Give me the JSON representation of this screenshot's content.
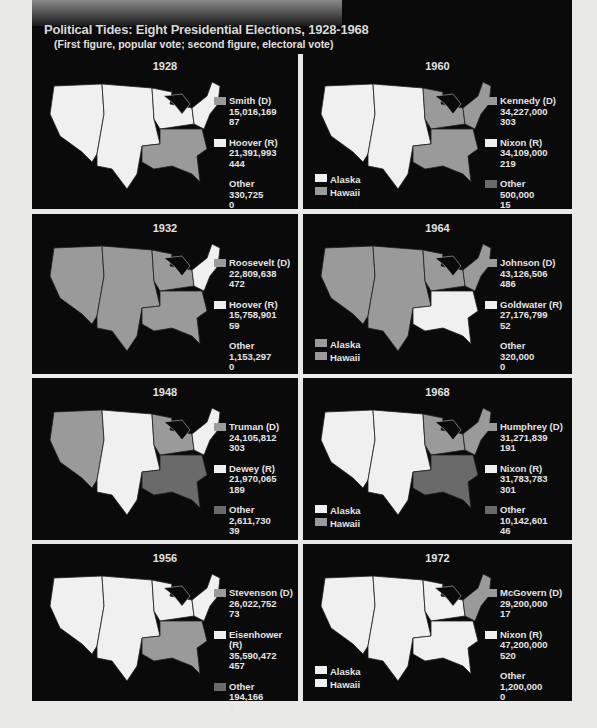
{
  "header": {
    "title": "Political Tides: Eight Presidential Elections, 1928-1968",
    "subtitle": "(First figure, popular vote; second figure, electoral vote)"
  },
  "colors": {
    "democrat": "#9a9a9a",
    "republican": "#f0f0f0",
    "other": "#6a6a6a",
    "background": "#0a0a0a",
    "page": "#e9e9e7"
  },
  "panels": [
    {
      "year": "1928",
      "entries": [
        {
          "name": "Smith (D)",
          "popular": "15,016,169",
          "electoral": "87",
          "swatch": "#9a9a9a"
        },
        {
          "name": "Hoover (R)",
          "popular": "21,391,993",
          "electoral": "444",
          "swatch": "#f0f0f0"
        },
        {
          "name": "Other",
          "popular": "330,725",
          "electoral": "0",
          "swatch": ""
        }
      ]
    },
    {
      "year": "1960",
      "alaska": "Alaska",
      "hawaii": "Hawaii",
      "alaska_color": "#f0f0f0",
      "hawaii_color": "#9a9a9a",
      "entries": [
        {
          "name": "Kennedy (D)",
          "popular": "34,227,000",
          "electoral": "303",
          "swatch": "#9a9a9a"
        },
        {
          "name": "Nixon (R)",
          "popular": "34,109,000",
          "electoral": "219",
          "swatch": "#f0f0f0"
        },
        {
          "name": "Other",
          "popular": "500,000",
          "electoral": "15",
          "swatch": "#6a6a6a"
        }
      ]
    },
    {
      "year": "1932",
      "entries": [
        {
          "name": "Roosevelt (D)",
          "popular": "22,809,638",
          "electoral": "472",
          "swatch": "#9a9a9a"
        },
        {
          "name": "Hoover (R)",
          "popular": "15,758,901",
          "electoral": "59",
          "swatch": "#f0f0f0"
        },
        {
          "name": "Other",
          "popular": "1,153,297",
          "electoral": "0",
          "swatch": ""
        }
      ]
    },
    {
      "year": "1964",
      "alaska": "Alaska",
      "hawaii": "Hawaii",
      "alaska_color": "#9a9a9a",
      "hawaii_color": "#9a9a9a",
      "entries": [
        {
          "name": "Johnson (D)",
          "popular": "43,126,506",
          "electoral": "486",
          "swatch": "#9a9a9a"
        },
        {
          "name": "Goldwater (R)",
          "popular": "27,176,799",
          "electoral": "52",
          "swatch": "#f0f0f0"
        },
        {
          "name": "Other",
          "popular": "320,000",
          "electoral": "0",
          "swatch": ""
        }
      ]
    },
    {
      "year": "1948",
      "entries": [
        {
          "name": "Truman (D)",
          "popular": "24,105,812",
          "electoral": "303",
          "swatch": "#9a9a9a"
        },
        {
          "name": "Dewey (R)",
          "popular": "21,970,065",
          "electoral": "189",
          "swatch": "#f0f0f0"
        },
        {
          "name": "Other",
          "popular": "2,611,730",
          "electoral": "39",
          "swatch": "#6a6a6a"
        }
      ]
    },
    {
      "year": "1968",
      "alaska": "Alaska",
      "hawaii": "Hawaii",
      "alaska_color": "#f0f0f0",
      "hawaii_color": "#9a9a9a",
      "entries": [
        {
          "name": "Humphrey (D)",
          "popular": "31,271,839",
          "electoral": "191",
          "swatch": "#9a9a9a"
        },
        {
          "name": "Nixon (R)",
          "popular": "31,783,783",
          "electoral": "301",
          "swatch": "#f0f0f0"
        },
        {
          "name": "Other",
          "popular": "10,142,601",
          "electoral": "46",
          "swatch": "#6a6a6a"
        }
      ]
    },
    {
      "year": "1956",
      "entries": [
        {
          "name": "Stevenson (D)",
          "popular": "26,022,752",
          "electoral": "73",
          "swatch": "#9a9a9a"
        },
        {
          "name": "Eisenhower (R)",
          "popular": "35,590,472",
          "electoral": "457",
          "swatch": "#f0f0f0"
        },
        {
          "name": "Other",
          "popular": "194,166",
          "electoral": "1",
          "swatch": "#6a6a6a"
        }
      ]
    },
    {
      "year": "1972",
      "alaska": "Alaska",
      "hawaii": "Hawaii",
      "alaska_color": "#f0f0f0",
      "hawaii_color": "#f0f0f0",
      "entries": [
        {
          "name": "McGovern (D)",
          "popular": "29,200,000",
          "electoral": "17",
          "swatch": "#9a9a9a"
        },
        {
          "name": "Nixon (R)",
          "popular": "47,200,000",
          "electoral": "520",
          "swatch": "#f0f0f0"
        },
        {
          "name": "Other",
          "popular": "1,200,000",
          "electoral": "0",
          "swatch": ""
        }
      ]
    }
  ]
}
